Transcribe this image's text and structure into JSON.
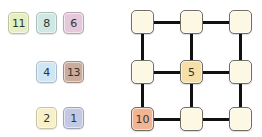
{
  "tray": {
    "tiles": [
      {
        "value": "11",
        "color": "#e6efc2",
        "x": 8,
        "y": 12
      },
      {
        "value": "8",
        "color": "#cfe8e3",
        "x": 36,
        "y": 12
      },
      {
        "value": "6",
        "color": "#e3c9d9",
        "x": 63,
        "y": 12
      },
      {
        "value": "4",
        "color": "#cfe6f4",
        "x": 36,
        "y": 61
      },
      {
        "value": "13",
        "color": "#c9ac9c",
        "x": 63,
        "y": 61
      },
      {
        "value": "2",
        "color": "#f7f0c8",
        "x": 36,
        "y": 107
      },
      {
        "value": "1",
        "color": "#c3c8e3",
        "x": 63,
        "y": 107
      }
    ]
  },
  "board": {
    "nodes": [
      {
        "id": "r0c0",
        "value": "",
        "color": "#fdf8e4",
        "x": 131,
        "y": 10
      },
      {
        "id": "r0c1",
        "value": "",
        "color": "#fdf8e4",
        "x": 180,
        "y": 10
      },
      {
        "id": "r0c2",
        "value": "",
        "color": "#fdf8e4",
        "x": 229,
        "y": 10
      },
      {
        "id": "r1c0",
        "value": "",
        "color": "#fdf8e4",
        "x": 131,
        "y": 60
      },
      {
        "id": "r1c1",
        "value": "5",
        "color": "#f7dfaa",
        "x": 180,
        "y": 60
      },
      {
        "id": "r1c2",
        "value": "",
        "color": "#fdf8e4",
        "x": 229,
        "y": 60
      },
      {
        "id": "r2c0",
        "value": "10",
        "color": "#f1b594",
        "x": 131,
        "y": 107
      },
      {
        "id": "r2c1",
        "value": "",
        "color": "#fdf8e4",
        "x": 180,
        "y": 107
      },
      {
        "id": "r2c2",
        "value": "",
        "color": "#fdf8e4",
        "x": 229,
        "y": 107
      }
    ]
  }
}
